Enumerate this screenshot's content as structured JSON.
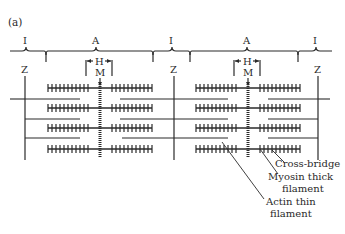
{
  "figure": {
    "panel_label": "(a)",
    "band_labels": {
      "i1": "I",
      "a1": "A",
      "i2": "I",
      "a2": "A",
      "i3": "I"
    },
    "h_labels": [
      "H",
      "H"
    ],
    "m_labels": [
      "M",
      "M"
    ],
    "z_labels": [
      "Z",
      "Z",
      "Z"
    ],
    "annotations": {
      "cross_bridge": "Cross-bridge",
      "myosin_line1": "Myosin thick",
      "myosin_line2": "filament",
      "actin_line1": "Actin thin",
      "actin_line2": "filament"
    },
    "colors": {
      "ink": "#2a2a2a",
      "background": "#ffffff"
    }
  }
}
